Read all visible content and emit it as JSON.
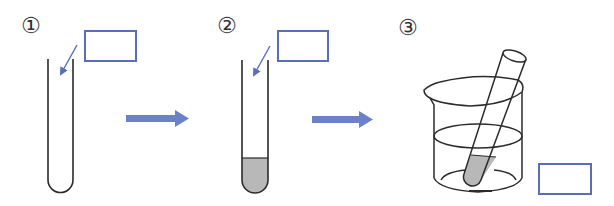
{
  "diagram": {
    "type": "experiment-procedure",
    "colors": {
      "line": "#2b2b2b",
      "accent_blue": "#6b82c8",
      "box_border": "#5a6db8",
      "fill_gray": "#b8b8b8",
      "background": "#ffffff"
    },
    "steps": [
      {
        "id": 1,
        "label": "①",
        "apparatus": "empty test tube",
        "answer_box": ""
      },
      {
        "id": 2,
        "label": "②",
        "apparatus": "test tube with substance at bottom",
        "answer_box": ""
      },
      {
        "id": 3,
        "label": "③",
        "apparatus": "test tube immersed in beaker of liquid",
        "answer_box": ""
      }
    ],
    "transitions": [
      {
        "from": 1,
        "to": 2,
        "icon": "right-arrow-icon"
      },
      {
        "from": 2,
        "to": 3,
        "icon": "right-arrow-icon"
      }
    ]
  }
}
